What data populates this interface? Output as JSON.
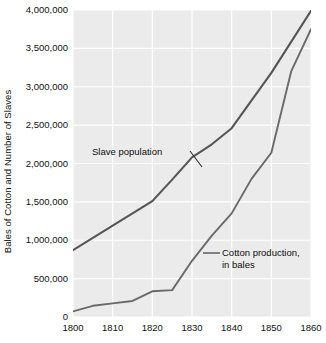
{
  "chart_data": {
    "type": "line",
    "title": "",
    "xlabel": "",
    "ylabel": "Bales of Cotton and Number of Slaves",
    "x": [
      1800,
      1810,
      1820,
      1830,
      1840,
      1850,
      1860
    ],
    "xlim": [
      1800,
      1860
    ],
    "ylim": [
      0,
      4000000
    ],
    "xticks": [
      "1800",
      "1810",
      "1820",
      "1830",
      "1840",
      "1850",
      "1860"
    ],
    "yticks": [
      "0",
      "500,000",
      "1,000,000",
      "1,500,000",
      "2,000,000",
      "2,500,000",
      "3,000,000",
      "3,500,000",
      "4,000,000"
    ],
    "ytick_values": [
      0,
      500000,
      1000000,
      1500000,
      2000000,
      2500000,
      3000000,
      3500000,
      4000000
    ],
    "grid": true,
    "legend_position": "inline-annotations",
    "series": [
      {
        "name": "Slave population",
        "color": "#555555",
        "x": [
          1800,
          1810,
          1820,
          1825,
          1830,
          1835,
          1840,
          1850,
          1860
        ],
        "values": [
          870000,
          1190000,
          1510000,
          1790000,
          2080000,
          2250000,
          2460000,
          3180000,
          3990000
        ]
      },
      {
        "name": "Cotton production, in bales",
        "color": "#6a6a6a",
        "x": [
          1800,
          1805,
          1810,
          1815,
          1820,
          1825,
          1830,
          1835,
          1840,
          1845,
          1850,
          1855,
          1860
        ],
        "values": [
          73000,
          146000,
          178000,
          209000,
          335000,
          350000,
          732000,
          1060000,
          1350000,
          1800000,
          2140000,
          3200000,
          3750000
        ]
      }
    ],
    "annotations": [
      {
        "name": "slave-population-label",
        "text": "Slave population",
        "leader": "diagonal-down-right"
      },
      {
        "name": "cotton-production-label",
        "line1": "Cotton production,",
        "line2": "in bales",
        "leader": "horizontal-left"
      }
    ],
    "colors": {
      "plot_background": "#ebebeb",
      "gridline": "#ffffff",
      "slave_line": "#555555",
      "cotton_line": "#6a6a6a",
      "text": "#111111"
    }
  }
}
